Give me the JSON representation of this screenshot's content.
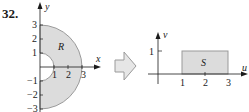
{
  "problem_number": "32.",
  "left_diagram": {
    "region_label": "R",
    "x_axis_label": "x",
    "y_axis_label": "y",
    "x_ticks": [
      "1",
      "2",
      "3"
    ],
    "y_ticks": [
      "3",
      "2",
      "1",
      "−1",
      "−2",
      "−3"
    ],
    "inner_radius": 1,
    "outer_radius": 3,
    "fill_color": "#dcdcdc",
    "edge_color": "#9a9a9a"
  },
  "arrow": {
    "fill_color": "#e6e6e6",
    "edge_color": "#9a9a9a"
  },
  "right_diagram": {
    "region_label": "S",
    "u_axis_label": "u",
    "v_axis_label": "v",
    "u_ticks": [
      "1",
      "2",
      "3"
    ],
    "v_ticks": [
      "1"
    ],
    "rect_u_range": [
      1,
      3
    ],
    "rect_v_range": [
      0,
      1
    ],
    "fill_color": "#dcdcdc",
    "edge_color": "#9a9a9a"
  }
}
